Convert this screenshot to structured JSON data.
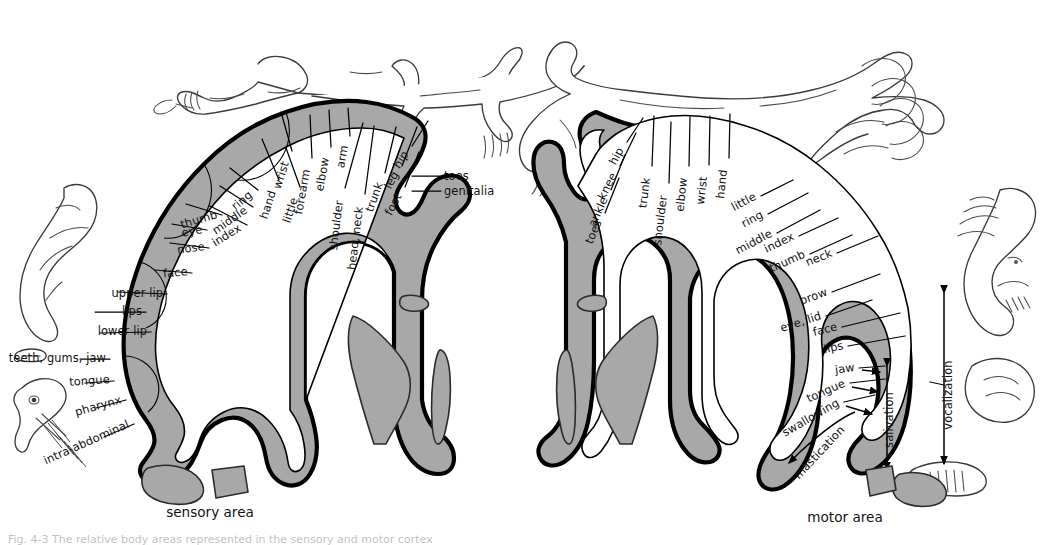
{
  "figure": {
    "caption_partial": "Fig. 4-3  The relative body areas represented in the sensory and motor cortex"
  },
  "panels": [
    {
      "id": "sensory",
      "area_label": "sensory area",
      "area_label_x": 210,
      "area_label_y": 517
    },
    {
      "id": "motor",
      "area_label": "motor area",
      "area_label_x": 845,
      "area_label_y": 522
    }
  ],
  "sensory_labels": [
    {
      "text": "wrist",
      "x": 289,
      "y": 163,
      "rot": -72,
      "anchor": "end",
      "lx1": 292,
      "ly1": 151,
      "lx2": 281,
      "ly2": 112
    },
    {
      "text": "hand",
      "x": 276,
      "y": 192,
      "rot": -72,
      "anchor": "end",
      "lx1": 279,
      "ly1": 180,
      "lx2": 262,
      "ly2": 139
    },
    {
      "text": "little",
      "x": 298,
      "y": 199,
      "rot": -72,
      "anchor": "end",
      "lx1": 300,
      "ly1": 187,
      "lx2": 286,
      "ly2": 148
    },
    {
      "text": "ring",
      "x": 253,
      "y": 196,
      "rot": -40,
      "anchor": "end",
      "lx1": 258,
      "ly1": 190,
      "lx2": 230,
      "ly2": 168
    },
    {
      "text": "middle",
      "x": 248,
      "y": 212,
      "rot": -35,
      "anchor": "end",
      "lx1": 253,
      "ly1": 207,
      "lx2": 220,
      "ly2": 186
    },
    {
      "text": "index",
      "x": 242,
      "y": 230,
      "rot": -32,
      "anchor": "end",
      "lx1": 247,
      "ly1": 225,
      "lx2": 210,
      "ly2": 206
    },
    {
      "text": "thumb",
      "x": 218,
      "y": 218,
      "rot": -16,
      "anchor": "end",
      "lx1": 222,
      "ly1": 215,
      "lx2": 186,
      "ly2": 204
    },
    {
      "text": "eye",
      "x": 203,
      "y": 233,
      "rot": -10,
      "anchor": "end",
      "lx1": 207,
      "ly1": 230,
      "lx2": 172,
      "ly2": 224
    },
    {
      "text": "nose",
      "x": 205,
      "y": 250,
      "rot": -8,
      "anchor": "end",
      "lx1": 209,
      "ly1": 248,
      "lx2": 170,
      "ly2": 243
    },
    {
      "text": "face",
      "x": 188,
      "y": 275,
      "rot": -6,
      "anchor": "end",
      "lx1": 192,
      "ly1": 273,
      "lx2": 155,
      "ly2": 270
    },
    {
      "text": "upper lip",
      "x": 163,
      "y": 297,
      "rot": 0,
      "anchor": "end",
      "lx1": 167,
      "ly1": 294,
      "lx2": 118,
      "ly2": 292
    },
    {
      "text": "lips",
      "x": 142,
      "y": 315,
      "rot": 0,
      "anchor": "end",
      "lx1": 146,
      "ly1": 312,
      "lx2": 95,
      "ly2": 312
    },
    {
      "text": "lower lip",
      "x": 147,
      "y": 335,
      "rot": 0,
      "anchor": "end",
      "lx1": 151,
      "ly1": 332,
      "lx2": 100,
      "ly2": 333
    },
    {
      "text": "teeth, gums, jaw",
      "x": 106,
      "y": 362,
      "rot": 0,
      "anchor": "end",
      "lx1": 110,
      "ly1": 359,
      "lx2": 80,
      "ly2": 359
    },
    {
      "text": "tongue",
      "x": 110,
      "y": 383,
      "rot": -4,
      "anchor": "end",
      "lx1": 114,
      "ly1": 381,
      "lx2": 85,
      "ly2": 383
    },
    {
      "text": "pharynx",
      "x": 122,
      "y": 403,
      "rot": -16,
      "anchor": "end",
      "lx1": 126,
      "ly1": 400,
      "lx2": 96,
      "ly2": 408
    },
    {
      "text": "intra-abdominal",
      "x": 130,
      "y": 427,
      "rot": -24,
      "anchor": "end",
      "lx1": 134,
      "ly1": 424,
      "lx2": 104,
      "ly2": 437
    },
    {
      "text": "forearm",
      "x": 310,
      "y": 170,
      "rot": -80,
      "anchor": "end",
      "lx1": 312,
      "ly1": 158,
      "lx2": 310,
      "ly2": 115
    },
    {
      "text": "elbow",
      "x": 329,
      "y": 158,
      "rot": -80,
      "anchor": "end",
      "lx1": 331,
      "ly1": 147,
      "lx2": 329,
      "ly2": 110
    },
    {
      "text": "arm",
      "x": 348,
      "y": 146,
      "rot": -80,
      "anchor": "end",
      "lx1": 350,
      "ly1": 136,
      "lx2": 348,
      "ly2": 108
    },
    {
      "text": "shoulder",
      "x": 343,
      "y": 201,
      "rot": -83,
      "anchor": "end",
      "lx1": 345,
      "ly1": 188,
      "lx2": 363,
      "ly2": 123
    },
    {
      "text": "head, neck",
      "x": 363,
      "y": 207,
      "rot": -83,
      "anchor": "end",
      "lx1": 365,
      "ly1": 194,
      "lx2": 374,
      "ly2": 126
    },
    {
      "text": "trunk",
      "x": 383,
      "y": 184,
      "rot": -70,
      "anchor": "end",
      "lx1": 385,
      "ly1": 173,
      "lx2": 396,
      "ly2": 127
    },
    {
      "text": "leg",
      "x": 399,
      "y": 174,
      "rot": -62,
      "anchor": "end",
      "lx1": 402,
      "ly1": 166,
      "lx2": 417,
      "ly2": 127
    },
    {
      "text": "hip",
      "x": 409,
      "y": 154,
      "rot": -58,
      "anchor": "end",
      "lx1": 412,
      "ly1": 146,
      "lx2": 428,
      "ly2": 121
    },
    {
      "text": "foot",
      "x": 402,
      "y": 196,
      "rot": -62,
      "anchor": "end",
      "lx1": 405,
      "ly1": 187,
      "lx2": 419,
      "ly2": 152
    },
    {
      "text": "toes",
      "x": 444,
      "y": 180,
      "rot": 0,
      "anchor": "start",
      "lx1": 441,
      "ly1": 176,
      "lx2": 412,
      "ly2": 176
    },
    {
      "text": "genitalia",
      "x": 444,
      "y": 195,
      "rot": 0,
      "anchor": "start",
      "lx1": 441,
      "ly1": 191,
      "lx2": 412,
      "ly2": 191
    }
  ],
  "motor_labels": [
    {
      "text": "hip",
      "x": 624,
      "y": 150,
      "rot": -62,
      "anchor": "end",
      "lx1": 627,
      "ly1": 142,
      "lx2": 643,
      "ly2": 118
    },
    {
      "text": "knee",
      "x": 617,
      "y": 175,
      "rot": -64,
      "anchor": "end",
      "lx1": 620,
      "ly1": 166,
      "lx2": 636,
      "ly2": 133
    },
    {
      "text": "ankle",
      "x": 608,
      "y": 199,
      "rot": -66,
      "anchor": "end",
      "lx1": 611,
      "ly1": 190,
      "lx2": 625,
      "ly2": 155
    },
    {
      "text": "toes",
      "x": 602,
      "y": 222,
      "rot": -66,
      "anchor": "end",
      "lx1": 605,
      "ly1": 213,
      "lx2": 619,
      "ly2": 178
    },
    {
      "text": "trunk",
      "x": 650,
      "y": 178,
      "rot": -83,
      "anchor": "end",
      "lx1": 652,
      "ly1": 166,
      "lx2": 654,
      "ly2": 116
    },
    {
      "text": "shoulder",
      "x": 667,
      "y": 196,
      "rot": -83,
      "anchor": "end",
      "lx1": 669,
      "ly1": 183,
      "lx2": 671,
      "ly2": 122
    },
    {
      "text": "elbow",
      "x": 687,
      "y": 178,
      "rot": -84,
      "anchor": "end",
      "lx1": 689,
      "ly1": 166,
      "lx2": 690,
      "ly2": 117
    },
    {
      "text": "wrist",
      "x": 707,
      "y": 177,
      "rot": -84,
      "anchor": "end",
      "lx1": 709,
      "ly1": 165,
      "lx2": 710,
      "ly2": 116
    },
    {
      "text": "hand",
      "x": 727,
      "y": 170,
      "rot": -84,
      "anchor": "end",
      "lx1": 729,
      "ly1": 158,
      "lx2": 730,
      "ly2": 114
    },
    {
      "text": "little",
      "x": 757,
      "y": 199,
      "rot": -28,
      "anchor": "end",
      "lx1": 761,
      "ly1": 196,
      "lx2": 793,
      "ly2": 180
    },
    {
      "text": "ring",
      "x": 764,
      "y": 217,
      "rot": -28,
      "anchor": "end",
      "lx1": 768,
      "ly1": 214,
      "lx2": 808,
      "ly2": 193
    },
    {
      "text": "middle",
      "x": 773,
      "y": 236,
      "rot": -28,
      "anchor": "end",
      "lx1": 777,
      "ly1": 233,
      "lx2": 820,
      "ly2": 210
    },
    {
      "text": "index",
      "x": 795,
      "y": 239,
      "rot": -26,
      "anchor": "end",
      "lx1": 799,
      "ly1": 236,
      "lx2": 838,
      "ly2": 218
    },
    {
      "text": "thumb",
      "x": 806,
      "y": 257,
      "rot": -24,
      "anchor": "end",
      "lx1": 810,
      "ly1": 254,
      "lx2": 852,
      "ly2": 235
    },
    {
      "text": "neck",
      "x": 833,
      "y": 256,
      "rot": -22,
      "anchor": "end",
      "lx1": 837,
      "ly1": 253,
      "lx2": 878,
      "ly2": 236
    },
    {
      "text": "brow",
      "x": 828,
      "y": 295,
      "rot": -20,
      "anchor": "end",
      "lx1": 832,
      "ly1": 292,
      "lx2": 880,
      "ly2": 274
    },
    {
      "text": "eye, lid",
      "x": 822,
      "y": 319,
      "rot": -18,
      "anchor": "end",
      "lx1": 826,
      "ly1": 316,
      "lx2": 872,
      "ly2": 300
    },
    {
      "text": "face",
      "x": 838,
      "y": 330,
      "rot": -14,
      "anchor": "end",
      "lx1": 842,
      "ly1": 327,
      "lx2": 900,
      "ly2": 313
    },
    {
      "text": "lips",
      "x": 844,
      "y": 349,
      "rot": -12,
      "anchor": "end",
      "lx1": 848,
      "ly1": 346,
      "lx2": 905,
      "ly2": 336
    },
    {
      "text": "jaw",
      "x": 855,
      "y": 371,
      "rot": -8,
      "anchor": "end",
      "lx1": 859,
      "ly1": 368,
      "lx2": 885,
      "ly2": 366
    },
    {
      "text": "tongue",
      "x": 846,
      "y": 386,
      "rot": -24,
      "anchor": "end",
      "lx1": 850,
      "ly1": 383,
      "lx2": 885,
      "ly2": 379
    },
    {
      "text": "swallowing",
      "x": 840,
      "y": 405,
      "rot": -30,
      "anchor": "end",
      "lx1": 844,
      "ly1": 402,
      "lx2": 875,
      "ly2": 395
    }
  ],
  "motor_vertical_labels": [
    {
      "text": "salivation",
      "x": 893,
      "y": 420,
      "rot": -90,
      "arrow_x": 887,
      "arrow_y1": 368,
      "arrow_y2": 468
    },
    {
      "text": "mastication",
      "x": 822,
      "y": 455,
      "rot": -47,
      "arrow_x1": 852,
      "arrow_y1": 418,
      "arrow_x2": 790,
      "arrow_y2": 486
    },
    {
      "text": "vocalization",
      "x": 952,
      "y": 395,
      "rot": -90,
      "arrow_x": 943,
      "arrow_y1": 295,
      "arrow_y2": 462
    }
  ]
}
